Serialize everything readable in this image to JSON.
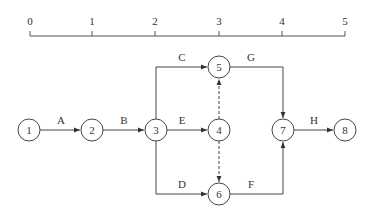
{
  "diagram": {
    "type": "activity-on-arrow network (time-scaled)",
    "colors": {
      "line": "#444444",
      "text": "#333333",
      "background": "#ffffff"
    },
    "timeline": {
      "ticks": [
        {
          "label": "0",
          "x": 30
        },
        {
          "label": "1",
          "x": 92
        },
        {
          "label": "2",
          "x": 155
        },
        {
          "label": "3",
          "x": 219
        },
        {
          "label": "4",
          "x": 282
        },
        {
          "label": "5",
          "x": 345
        }
      ]
    },
    "nodes": [
      {
        "id": "1",
        "label": "1",
        "x": 29,
        "y": 130
      },
      {
        "id": "2",
        "label": "2",
        "x": 92,
        "y": 130
      },
      {
        "id": "3",
        "label": "3",
        "x": 156,
        "y": 130
      },
      {
        "id": "4",
        "label": "4",
        "x": 219,
        "y": 130
      },
      {
        "id": "5",
        "label": "5",
        "x": 219,
        "y": 67
      },
      {
        "id": "6",
        "label": "6",
        "x": 219,
        "y": 194
      },
      {
        "id": "7",
        "label": "7",
        "x": 283,
        "y": 130
      },
      {
        "id": "8",
        "label": "8",
        "x": 345,
        "y": 130
      }
    ],
    "edges": [
      {
        "label": "A",
        "from": "1",
        "to": "2",
        "style": "solid"
      },
      {
        "label": "B",
        "from": "2",
        "to": "3",
        "style": "solid"
      },
      {
        "label": "C",
        "from": "3",
        "to": "5",
        "style": "solid"
      },
      {
        "label": "E",
        "from": "3",
        "to": "4",
        "style": "solid"
      },
      {
        "label": "D",
        "from": "3",
        "to": "6",
        "style": "solid"
      },
      {
        "label": "",
        "from": "4",
        "to": "5",
        "style": "dashed"
      },
      {
        "label": "",
        "from": "4",
        "to": "6",
        "style": "dashed"
      },
      {
        "label": "G",
        "from": "5",
        "to": "7",
        "style": "solid"
      },
      {
        "label": "F",
        "from": "6",
        "to": "7",
        "style": "solid"
      },
      {
        "label": "H",
        "from": "7",
        "to": "8",
        "style": "solid"
      }
    ]
  }
}
